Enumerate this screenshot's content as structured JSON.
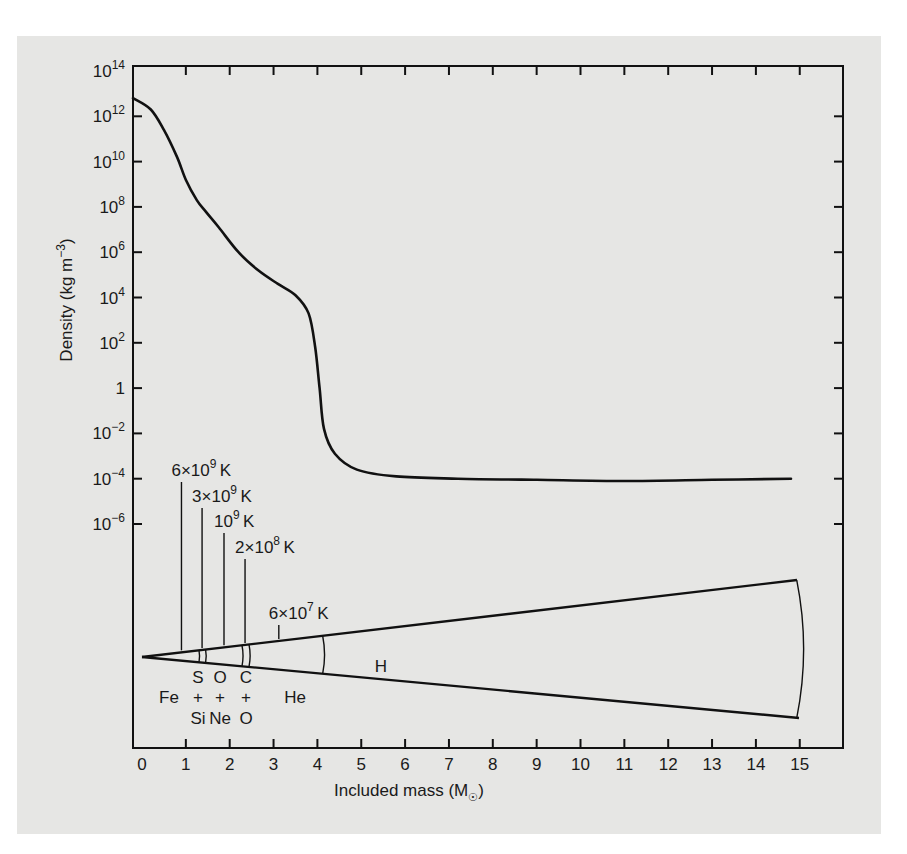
{
  "chart_data": {
    "type": "line",
    "title": "",
    "xlabel": "Included mass (M☉)",
    "ylabel": "Density (kg m⁻³)",
    "xlim": [
      0,
      15.9
    ],
    "ylim_log10": [
      -7,
      14
    ],
    "y_scale": "log",
    "grid": false,
    "legend": null,
    "x_ticks": [
      "0",
      "1",
      "2",
      "3",
      "4",
      "5",
      "6",
      "7",
      "8",
      "9",
      "10",
      "11",
      "12",
      "13",
      "14",
      "15"
    ],
    "y_ticks": [
      {
        "base": "10",
        "exp": "14"
      },
      {
        "base": "10",
        "exp": "12"
      },
      {
        "base": "10",
        "exp": "10"
      },
      {
        "base": "10",
        "exp": "8"
      },
      {
        "base": "10",
        "exp": "6"
      },
      {
        "base": "10",
        "exp": "4"
      },
      {
        "base": "10",
        "exp": "2"
      },
      {
        "base": "1",
        "exp": ""
      },
      {
        "base": "10",
        "exp": "−2"
      },
      {
        "base": "10",
        "exp": "−4"
      },
      {
        "base": "10",
        "exp": "−6"
      }
    ],
    "series": [
      {
        "name": "Density",
        "x": [
          0,
          0.2,
          0.5,
          0.8,
          1.0,
          1.25,
          1.45,
          1.75,
          2.2,
          2.65,
          3.1,
          3.5,
          3.8,
          3.95,
          4.05,
          4.15,
          4.4,
          4.9,
          5.8,
          7.2,
          9,
          11,
          13,
          14.8
        ],
        "log10_y": [
          12.8,
          12.3,
          11.4,
          10.2,
          9.2,
          8.3,
          7.8,
          7.1,
          6.0,
          5.2,
          4.6,
          4.1,
          3.3,
          1.8,
          0.0,
          -1.8,
          -2.9,
          -3.6,
          -3.9,
          -4.0,
          -4.05,
          -4.1,
          -4.05,
          -4.0
        ]
      }
    ],
    "annotations": {
      "temperature_markers": [
        {
          "label_base": "6×10",
          "label_exp": "9",
          "unit": "K",
          "mass": 0.9
        },
        {
          "label_base": "3×10",
          "label_exp": "9",
          "unit": "K",
          "mass": 1.37
        },
        {
          "label_base": "10",
          "label_exp": "9",
          "unit": "K",
          "mass": 1.87
        },
        {
          "label_base": "2×10",
          "label_exp": "8",
          "unit": "K",
          "mass": 2.35
        },
        {
          "label_base": "6×10",
          "label_exp": "7",
          "unit": "K",
          "mass": 3.12
        }
      ],
      "shell_boundaries_mass": [
        1.3,
        1.45,
        2.28,
        2.44,
        4.12,
        15.0
      ],
      "composition_labels": [
        {
          "top": "",
          "mid": "Fe",
          "bottom": ""
        },
        {
          "top": "S",
          "mid": "+",
          "bottom": "Si"
        },
        {
          "top": "O",
          "mid": "+",
          "bottom": "Ne"
        },
        {
          "top": "C",
          "mid": "+",
          "bottom": "O"
        },
        {
          "top": "",
          "mid": "He",
          "bottom": ""
        },
        {
          "top": "H",
          "mid": "",
          "bottom": ""
        }
      ]
    }
  }
}
